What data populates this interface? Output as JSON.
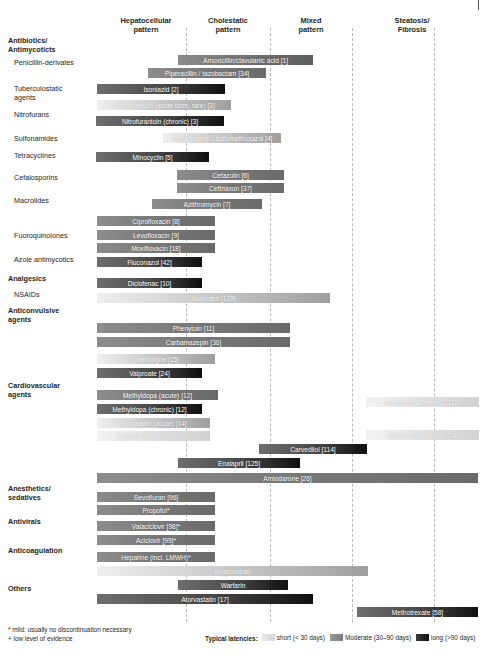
{
  "columns": [
    {
      "label": "Hepatocellular\npattern",
      "center": 146
    },
    {
      "label": "Cholestatic\npattern",
      "center": 228
    },
    {
      "label": "Mixed\npattern",
      "center": 311
    },
    {
      "label": "Steatosis/\nFibrosis",
      "center": 412
    }
  ],
  "gridlines": [
    186,
    270,
    352,
    434
  ],
  "categories": [
    {
      "label": "Antibiotics/\nAntimycoticts",
      "bold": true,
      "x": 8,
      "y": 37
    },
    {
      "label": "Penicillin-derivates",
      "bold": false,
      "x": 14,
      "y": 59
    },
    {
      "label": "Tuberculostatic\nagents",
      "bold": false,
      "x": 14,
      "y": 85
    },
    {
      "label": "Nitrofurans",
      "bold": false,
      "x": 14,
      "y": 111
    },
    {
      "label": "Sulfonamides",
      "bold": false,
      "x": 14,
      "y": 135
    },
    {
      "label": "Tetracyclines",
      "bold": false,
      "x": 14,
      "y": 152
    },
    {
      "label": "Cefalosporins",
      "bold": false,
      "x": 14,
      "y": 174
    },
    {
      "label": "Macrolides",
      "bold": false,
      "x": 14,
      "y": 197
    },
    {
      "label": "Fuoroquinolones",
      "bold": false,
      "x": 14,
      "y": 232
    },
    {
      "label": "Azole antimycotics",
      "bold": false,
      "x": 14,
      "y": 256
    },
    {
      "label": "Analgesics",
      "bold": true,
      "x": 8,
      "y": 275
    },
    {
      "label": "NSAIDs",
      "bold": false,
      "x": 14,
      "y": 291
    },
    {
      "label": "Anticonvulsive\nagents",
      "bold": true,
      "x": 8,
      "y": 307
    },
    {
      "label": "Cardiovascular\nagents",
      "bold": true,
      "x": 8,
      "y": 382
    },
    {
      "label": "Anesthetics/\nsedatives",
      "bold": true,
      "x": 8,
      "y": 485
    },
    {
      "label": "Antivirals",
      "bold": true,
      "x": 8,
      "y": 518
    },
    {
      "label": "Anticoagulation",
      "bold": true,
      "x": 8,
      "y": 547
    },
    {
      "label": "Others",
      "bold": true,
      "x": 8,
      "y": 585
    }
  ],
  "chart_data": {
    "type": "bar",
    "xlabel": "",
    "ylabel": "",
    "axis_categories": [
      "Hepatocellular pattern",
      "Cholestatic pattern",
      "Mixed pattern",
      "Steatosis/Fibrosis"
    ],
    "legend_position": "bottom",
    "grid": true,
    "latency_scale": [
      "short (< 30 days)",
      "Moderate (30-90 days)",
      "long (>90 days)"
    ],
    "bars": [
      {
        "label": "Amoxicillin/clavulanic acid [1]",
        "x": 178,
        "w": 135,
        "y": 55,
        "g": "l-md"
      },
      {
        "label": "Piperacillin / tazobactam [34]",
        "x": 148,
        "w": 118,
        "y": 68,
        "g": "md"
      },
      {
        "label": "Isoniazid [2]",
        "x": 97,
        "w": 128,
        "y": 84,
        "g": "ml"
      },
      {
        "label": "Nitrofurantoin (acute form, rare) [3]",
        "x": 97,
        "w": 134,
        "y": 100,
        "g": "s-m"
      },
      {
        "label": "Nitrofurantoin (chronic) [3]",
        "x": 96,
        "w": 128,
        "y": 116,
        "g": "ml"
      },
      {
        "label": "Trimethoprim / sulfomethoxazol [4]",
        "x": 163,
        "w": 118,
        "y": 133,
        "g": "s-m"
      },
      {
        "label": "Minocyclin [5]",
        "x": 96,
        "w": 113,
        "y": 152,
        "g": "ml"
      },
      {
        "label": "Cefazolin [6]",
        "x": 177,
        "w": 107,
        "y": 170,
        "g": "md"
      },
      {
        "label": "Ceftriaxon [37]",
        "x": 177,
        "w": 107,
        "y": 183,
        "g": "md"
      },
      {
        "label": "Azithromycin [7]",
        "x": 152,
        "w": 110,
        "y": 199,
        "g": "md"
      },
      {
        "label": "Ciprofloxacin [8]",
        "x": 97,
        "w": 118,
        "y": 216,
        "g": "md"
      },
      {
        "label": "Levofloxacin [9]",
        "x": 97,
        "w": 118,
        "y": 230,
        "g": "md"
      },
      {
        "label": "Moxifloxacin [18]",
        "x": 97,
        "w": 118,
        "y": 243,
        "g": "md"
      },
      {
        "label": "Fluconazol [42]",
        "x": 97,
        "w": 105,
        "y": 257,
        "g": "ml"
      },
      {
        "label": "Diclofenac [10]",
        "x": 97,
        "w": 105,
        "y": 278,
        "g": "ml"
      },
      {
        "label": "Ibuprofen [139]",
        "x": 97,
        "w": 233,
        "y": 293,
        "g": "s-m"
      },
      {
        "label": "Phenytoin [11]",
        "x": 97,
        "w": 193,
        "y": 323,
        "g": "md"
      },
      {
        "label": "Carbamazepin [36]",
        "x": 97,
        "w": 193,
        "y": 337,
        "g": "md"
      },
      {
        "label": "Lamotrigne [15]",
        "x": 97,
        "w": 118,
        "y": 354,
        "g": "s-m"
      },
      {
        "label": "Valproate [24]",
        "x": 97,
        "w": 105,
        "y": 368,
        "g": "ml"
      },
      {
        "label": "Methyldopa (acute) [12]",
        "x": 97,
        "w": 121,
        "y": 390,
        "g": "md"
      },
      {
        "label": "Methyldopa (chronic) [12]",
        "x": 97,
        "w": 105,
        "y": 404,
        "g": "ml"
      },
      {
        "label": "Methyldopa (chronic) [12]",
        "x": 366,
        "w": 113,
        "y": 397,
        "g": "s"
      },
      {
        "label": "Hydralazin (acute) [14]",
        "x": 97,
        "w": 113,
        "y": 418,
        "g": "s-m"
      },
      {
        "label": "Hydralazin (chronic) [14]",
        "x": 97,
        "w": 113,
        "y": 431,
        "g": "s"
      },
      {
        "label": "Hydralazin (chronic) [14]",
        "x": 366,
        "w": 113,
        "y": 430,
        "g": "s"
      },
      {
        "label": "Carvedilol [114]",
        "x": 259,
        "w": 108,
        "y": 444,
        "g": "ml"
      },
      {
        "label": "Enalapril [125]",
        "x": 178,
        "w": 122,
        "y": 458,
        "g": "ml"
      },
      {
        "label": "Amiodarone [26]",
        "x": 97,
        "w": 381,
        "y": 473,
        "g": "md"
      },
      {
        "label": "Sevofluran [96]",
        "x": 97,
        "w": 118,
        "y": 492,
        "g": "md"
      },
      {
        "label": "Propofol*",
        "x": 97,
        "w": 118,
        "y": 505,
        "g": "md"
      },
      {
        "label": "Valaciclovir [98]*",
        "x": 97,
        "w": 118,
        "y": 521,
        "g": "md"
      },
      {
        "label": "Aciclovir [99]*",
        "x": 97,
        "w": 118,
        "y": 535,
        "g": "md"
      },
      {
        "label": "Heparine (incl. LMWH)*",
        "x": 97,
        "w": 118,
        "y": 552,
        "g": "md"
      },
      {
        "label": "Rivaroxaban",
        "x": 97,
        "w": 271,
        "y": 566,
        "g": "s-m"
      },
      {
        "label": "Warfarin",
        "x": 178,
        "w": 110,
        "y": 580,
        "g": "ml"
      },
      {
        "label": "Atorvastatin [17]",
        "x": 97,
        "w": 216,
        "y": 594,
        "g": "ml"
      },
      {
        "label": "Methotrexate [58]",
        "x": 357,
        "w": 121,
        "y": 607,
        "g": "ml"
      }
    ]
  },
  "footnote": "* mild: usually no discontinuation necessary\n+ low level of evidence",
  "legend": {
    "title": "Typical latencies:",
    "items": [
      {
        "label": "short (< 30 days)",
        "swatch": "sw-short"
      },
      {
        "label": "Moderate (30–90 days)",
        "swatch": "sw-moderate"
      },
      {
        "label": "long (>90 days)",
        "swatch": "sw-long"
      }
    ]
  }
}
